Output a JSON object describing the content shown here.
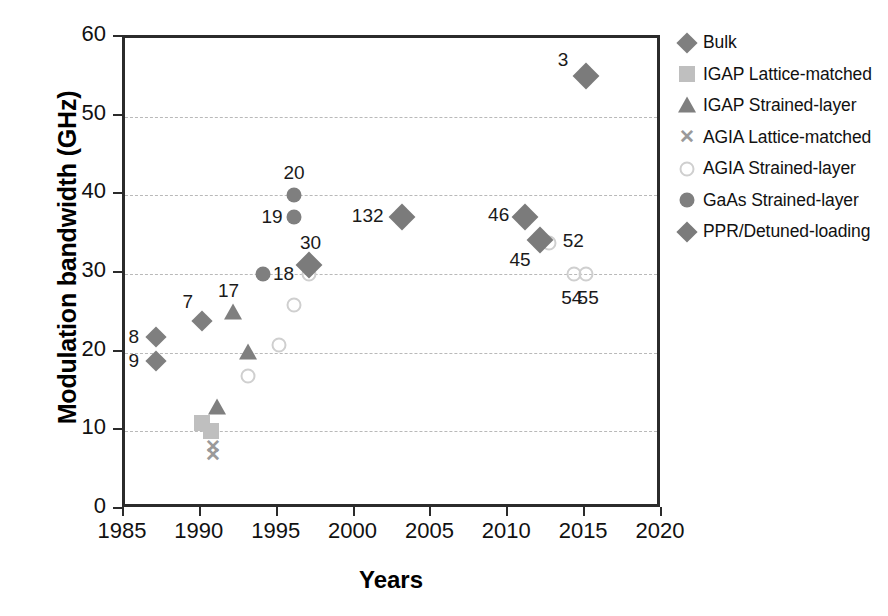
{
  "chart_data": {
    "type": "scatter",
    "title": "",
    "xlabel": "Years",
    "ylabel": "Modulation bandwidth (GHz)",
    "xlim": [
      1985,
      2020
    ],
    "ylim": [
      0,
      60
    ],
    "xticks": [
      1985,
      1990,
      1995,
      2000,
      2005,
      2010,
      2015,
      2020
    ],
    "yticks": [
      0,
      10,
      20,
      30,
      40,
      50,
      60
    ],
    "grid": "horizontal-dashed",
    "legend_position": "right",
    "legend": [
      {
        "label": "Bulk",
        "marker": "diamond",
        "color": "#7f7f7f"
      },
      {
        "label": "IGAP Lattice-matched",
        "marker": "square",
        "color": "#bfbfbf"
      },
      {
        "label": "IGAP Strained-layer",
        "marker": "triangle",
        "color": "#7f7f7f"
      },
      {
        "label": "AGIA Lattice-matched",
        "marker": "x",
        "color": "#9a9a9a"
      },
      {
        "label": "AGIA  Strained-layer",
        "marker": "circle-open",
        "color": "#cfcfcf"
      },
      {
        "label": "GaAs Strained-layer",
        "marker": "circle-fill",
        "color": "#7f7f7f"
      },
      {
        "label": "PPR/Detuned-loading",
        "marker": "diamond",
        "color": "#7b7b7b"
      }
    ],
    "series": [
      {
        "name": "Bulk",
        "marker": "diamond",
        "points": [
          {
            "x": 1987.0,
            "y": 22.0,
            "label": "8",
            "label_dx": -22,
            "label_dy": 0
          },
          {
            "x": 1987.0,
            "y": 19.0,
            "label": "9",
            "label_dx": -22,
            "label_dy": 0
          },
          {
            "x": 1990.0,
            "y": 24.0,
            "label": "7",
            "label_dx": -14,
            "label_dy": -19
          }
        ]
      },
      {
        "name": "IGAP Lattice-matched",
        "marker": "square",
        "points": [
          {
            "x": 1990.0,
            "y": 11.0,
            "label": "",
            "label_dx": 0,
            "label_dy": 0
          },
          {
            "x": 1990.6,
            "y": 10.0,
            "label": "",
            "label_dx": 0,
            "label_dy": 0
          }
        ]
      },
      {
        "name": "IGAP Strained-layer",
        "marker": "triangle",
        "points": [
          {
            "x": 1991.0,
            "y": 13.0,
            "label": "",
            "label_dx": 0,
            "label_dy": 0
          },
          {
            "x": 1992.0,
            "y": 25.0,
            "label": "17",
            "label_dx": -4,
            "label_dy": -22
          },
          {
            "x": 1993.0,
            "y": 20.0,
            "label": "",
            "label_dx": 0,
            "label_dy": 0
          }
        ]
      },
      {
        "name": "AGIA Lattice-matched",
        "marker": "x",
        "points": [
          {
            "x": 1990.7,
            "y": 8.0,
            "label": "",
            "label_dx": 0,
            "label_dy": 0
          },
          {
            "x": 1990.7,
            "y": 7.0,
            "label": "",
            "label_dx": 0,
            "label_dy": 0
          }
        ]
      },
      {
        "name": "AGIA  Strained-layer",
        "marker": "circle-open",
        "points": [
          {
            "x": 1993.0,
            "y": 17.0,
            "label": "",
            "label_dx": 0,
            "label_dy": 0
          },
          {
            "x": 1995.0,
            "y": 21.0,
            "label": "",
            "label_dx": 0,
            "label_dy": 0
          },
          {
            "x": 1996.0,
            "y": 26.0,
            "label": "",
            "label_dx": 0,
            "label_dy": 0
          },
          {
            "x": 1997.0,
            "y": 30.0,
            "label": "18",
            "label_dx": -26,
            "label_dy": 0
          },
          {
            "x": 2012.6,
            "y": 34.0,
            "label": "52",
            "label_dx": 24,
            "label_dy": -2
          },
          {
            "x": 2014.2,
            "y": 30.0,
            "label": "54",
            "label_dx": -2,
            "label_dy": 24
          },
          {
            "x": 2015.0,
            "y": 30.0,
            "label": "55",
            "label_dx": 2,
            "label_dy": 24
          }
        ]
      },
      {
        "name": "GaAs Strained-layer",
        "marker": "circle-fill",
        "points": [
          {
            "x": 1994.0,
            "y": 30.0,
            "label": "",
            "label_dx": 0,
            "label_dy": 0
          },
          {
            "x": 1996.0,
            "y": 40.0,
            "label": "20",
            "label_dx": 0,
            "label_dy": -22
          },
          {
            "x": 1996.0,
            "y": 37.2,
            "label": "19",
            "label_dx": -22,
            "label_dy": 0
          }
        ]
      },
      {
        "name": "PPR/Detuned-loading",
        "marker": "diamond-lg",
        "points": [
          {
            "x": 1997.0,
            "y": 31.2,
            "label": "30",
            "label_dx": 1,
            "label_dy": -22
          },
          {
            "x": 2003.0,
            "y": 37.2,
            "label": "132",
            "label_dx": -34,
            "label_dy": -1
          },
          {
            "x": 2011.0,
            "y": 37.2,
            "label": "46",
            "label_dx": -26,
            "label_dy": -2
          },
          {
            "x": 2012.0,
            "y": 34.3,
            "label": "45",
            "label_dx": -20,
            "label_dy": 20
          },
          {
            "x": 2015.0,
            "y": 55.2,
            "label": "3",
            "label_dx": -23,
            "label_dy": -16
          }
        ]
      }
    ]
  }
}
